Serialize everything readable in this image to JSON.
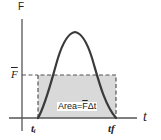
{
  "diagram": {
    "y_axis_label": "F",
    "x_axis_label": "t",
    "average_force_label": "F̄",
    "average_force_bar_char": "F",
    "start_time_label": "tᵢ",
    "end_time_label": "t_f",
    "start_time_text": "tᵢ",
    "end_time_text": "tf",
    "area_label": "Area=F̄Δt",
    "area_label_prefix": "Area=",
    "area_label_F": "F",
    "area_label_suffix": "Δt",
    "colors": {
      "axis": "#555555",
      "curve": "#3a3a3a",
      "rectangle_fill": "#d9d9d9",
      "dashed_border": "#555555",
      "text": "#222222"
    },
    "elements": [
      {
        "type": "axis",
        "name": "force-axis",
        "label": "F"
      },
      {
        "type": "axis",
        "name": "time-axis",
        "label": "t"
      },
      {
        "type": "curve",
        "name": "force-pulse-curve",
        "shape": "bell"
      },
      {
        "type": "rectangle",
        "name": "average-force-rectangle",
        "style": "dashed",
        "fill": "gray"
      }
    ]
  }
}
